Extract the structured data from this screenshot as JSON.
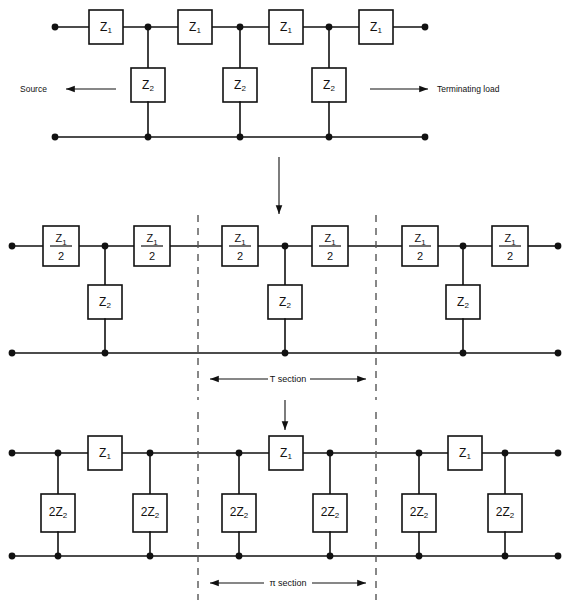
{
  "figure": {
    "background_color": "#ffffff",
    "line_color": "#111111",
    "dashed_color": "#555555"
  },
  "annotations": {
    "source_label": "Source",
    "load_label": "Terminating load",
    "t_section_label": "T section",
    "pi_section_label": "π section"
  },
  "components": {
    "z1": "Z",
    "z1_sub": "1",
    "z2": "Z",
    "z2_sub": "2",
    "z1_half_num": "Z",
    "z1_half_num_sub": "1",
    "z1_half_den": "2",
    "two_z2": "2Z",
    "two_z2_sub": "2"
  },
  "row_top": {
    "name": "ladder-network-row",
    "series_count": 4,
    "shunt_count": 3,
    "series_labels": [
      "Z1",
      "Z1",
      "Z1",
      "Z1"
    ],
    "shunt_labels": [
      "Z2",
      "Z2",
      "Z2"
    ],
    "top_rail_y": 27,
    "bottom_rail_y": 137,
    "left_terminal_x": 55,
    "right_terminal_x": 425,
    "node_x": [
      148,
      240,
      329
    ],
    "series_box_x": [
      89,
      178,
      269,
      359
    ],
    "box_w": 34,
    "box_h": 34
  },
  "row_middle": {
    "name": "t-section-row",
    "series_count": 6,
    "shunt_count": 3,
    "series_labels": [
      "Z1/2",
      "Z1/2",
      "Z1/2",
      "Z1/2",
      "Z1/2",
      "Z1/2"
    ],
    "shunt_labels": [
      "Z2",
      "Z2",
      "Z2"
    ],
    "top_rail_y": 246,
    "bottom_rail_y": 353,
    "left_terminal_x": 12,
    "right_terminal_x": 558,
    "node_x": [
      105,
      285,
      463
    ],
    "series_box_x": [
      43,
      134,
      222,
      312,
      402,
      492
    ],
    "box_w": 36,
    "box_h": 40,
    "dividers_x": [
      198,
      376
    ]
  },
  "row_bottom": {
    "name": "pi-section-row",
    "series_count": 3,
    "shunt_count": 6,
    "series_labels": [
      "Z1",
      "Z1",
      "Z1"
    ],
    "shunt_labels": [
      "2Z2",
      "2Z2",
      "2Z2",
      "2Z2",
      "2Z2",
      "2Z2"
    ],
    "top_rail_y": 453,
    "bottom_rail_y": 556,
    "left_terminal_x": 12,
    "right_terminal_x": 558,
    "node_x": [
      58,
      150,
      239,
      330,
      419,
      505
    ],
    "series_box_x": [
      88,
      269,
      448
    ],
    "box_w": 34,
    "box_h": 34,
    "dividers_x": [
      198,
      376
    ]
  },
  "flow_arrows": {
    "top_to_middle_x": 279,
    "top_to_middle_y1": 157,
    "top_to_middle_y2": 215,
    "middle_to_bottom_x": 285,
    "middle_to_bottom_y1": 400,
    "middle_to_bottom_y2": 432
  },
  "measure_bars": {
    "t_section": {
      "x1": 199,
      "x2": 375,
      "y": 379
    },
    "pi_section": {
      "x1": 199,
      "x2": 375,
      "y": 583
    }
  }
}
